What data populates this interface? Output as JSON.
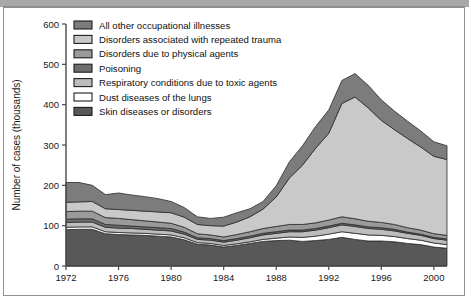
{
  "chart_data": {
    "type": "area",
    "title": "",
    "subtitle": "",
    "xlabel": "",
    "ylabel": "Number of cases (thousands)",
    "stacked": true,
    "grid": false,
    "legend_position": "top-left",
    "xlim": [
      1972,
      2001
    ],
    "ylim": [
      0,
      600
    ],
    "ytick_labels": [
      "0",
      "100",
      "200",
      "300",
      "400",
      "500",
      "600"
    ],
    "yticks": [
      0,
      100,
      200,
      300,
      400,
      500,
      600
    ],
    "xtick_labels": [
      "1972",
      "1976",
      "1980",
      "1984",
      "1988",
      "1992",
      "1996",
      "2000"
    ],
    "xticks": [
      1972,
      1976,
      1980,
      1984,
      1988,
      1992,
      1996,
      2000
    ],
    "x": [
      1972,
      1973,
      1974,
      1975,
      1976,
      1977,
      1978,
      1979,
      1980,
      1981,
      1982,
      1983,
      1984,
      1985,
      1986,
      1987,
      1988,
      1989,
      1990,
      1991,
      1992,
      1993,
      1994,
      1995,
      1996,
      1997,
      1998,
      1999,
      2000,
      2001
    ],
    "series": [
      {
        "name": "Skin diseases or disorders",
        "color": "#585858",
        "values": [
          90,
          91,
          91,
          80,
          78,
          77,
          76,
          74,
          72,
          65,
          54,
          52,
          47,
          51,
          56,
          61,
          63,
          64,
          61,
          63,
          66,
          71,
          66,
          62,
          62,
          60,
          56,
          53,
          47,
          44
        ]
      },
      {
        "name": "Dust diseases of the lungs",
        "color": "#ffffff",
        "values": [
          6,
          6,
          6,
          5,
          5,
          5,
          5,
          5,
          5,
          5,
          4,
          4,
          4,
          4,
          4,
          5,
          6,
          8,
          10,
          11,
          13,
          14,
          15,
          15,
          14,
          13,
          12,
          11,
          10,
          9
        ]
      },
      {
        "name": "Respiratory conditions due to toxic agents",
        "color": "#bdbdbd",
        "values": [
          12,
          12,
          12,
          11,
          11,
          11,
          10,
          10,
          10,
          9,
          8,
          8,
          8,
          9,
          10,
          11,
          12,
          13,
          14,
          15,
          16,
          17,
          17,
          16,
          15,
          14,
          13,
          12,
          11,
          11
        ]
      },
      {
        "name": "Poisoning",
        "color": "#6e6e6e",
        "values": [
          8,
          8,
          8,
          7,
          7,
          6,
          6,
          6,
          6,
          5,
          4,
          4,
          4,
          4,
          4,
          4,
          4,
          4,
          4,
          4,
          4,
          4,
          4,
          4,
          4,
          4,
          3,
          3,
          3,
          3
        ]
      },
      {
        "name": "Disorders due to physical agents",
        "color": "#9a9a9a",
        "values": [
          19,
          19,
          19,
          17,
          17,
          16,
          15,
          14,
          13,
          12,
          10,
          9,
          9,
          10,
          11,
          12,
          13,
          14,
          14,
          14,
          15,
          16,
          15,
          14,
          13,
          12,
          11,
          10,
          9,
          9
        ]
      },
      {
        "name": "Disorders associated with repeated trauma",
        "color": "#c9c9c9",
        "values": [
          23,
          23,
          24,
          22,
          22,
          23,
          24,
          25,
          26,
          25,
          23,
          23,
          27,
          31,
          37,
          48,
          73,
          115,
          147,
          185,
          215,
          281,
          302,
          281,
          253,
          235,
          221,
          206,
          192,
          188
        ]
      },
      {
        "name": "All other occupational illnesses",
        "color": "#7c7c7c",
        "values": [
          49,
          48,
          40,
          35,
          41,
          38,
          36,
          33,
          28,
          24,
          19,
          18,
          22,
          23,
          20,
          19,
          28,
          40,
          48,
          54,
          58,
          57,
          58,
          56,
          51,
          46,
          43,
          40,
          36,
          34
        ]
      }
    ],
    "legend_order_top_to_bottom": [
      "All other occupational illnesses",
      "Disorders associated with repeated trauma",
      "Disorders due to physical agents",
      "Poisoning",
      "Respiratory conditions due to toxic agents",
      "Dust diseases of the lungs",
      "Skin diseases or disorders"
    ],
    "legend": [
      {
        "label": "All other occupational illnesses",
        "swatch": "#7c7c7c"
      },
      {
        "label": "Disorders associated with repeated trauma",
        "swatch": "#c9c9c9"
      },
      {
        "label": "Disorders due to physical agents",
        "swatch": "#9a9a9a"
      },
      {
        "label": "Poisoning",
        "swatch": "#6e6e6e"
      },
      {
        "label": "Respiratory conditions due to toxic agents",
        "swatch": "#bdbdbd"
      },
      {
        "label": "Dust diseases of the lungs",
        "swatch": "#ffffff"
      },
      {
        "label": "Skin diseases or disorders",
        "swatch": "#585858"
      }
    ]
  }
}
